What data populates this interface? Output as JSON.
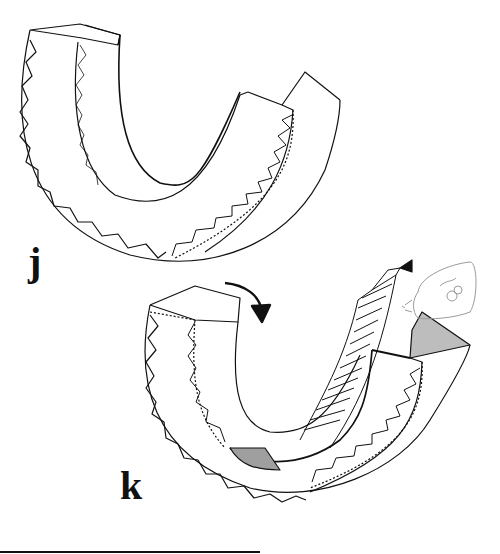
{
  "figure": {
    "panels": [
      {
        "id": "j",
        "label": "j",
        "description": "U-shaped toothed segment, assembled view"
      },
      {
        "id": "k",
        "label": "k",
        "description": "U-shaped toothed segment with inner strip being rolled in, arrow indicating rotation, glue/tube applicator at right"
      }
    ],
    "colors": {
      "line": "#111111",
      "shade": "#bdbdbd",
      "faint": "#9a9a9a",
      "background": "#ffffff"
    }
  }
}
